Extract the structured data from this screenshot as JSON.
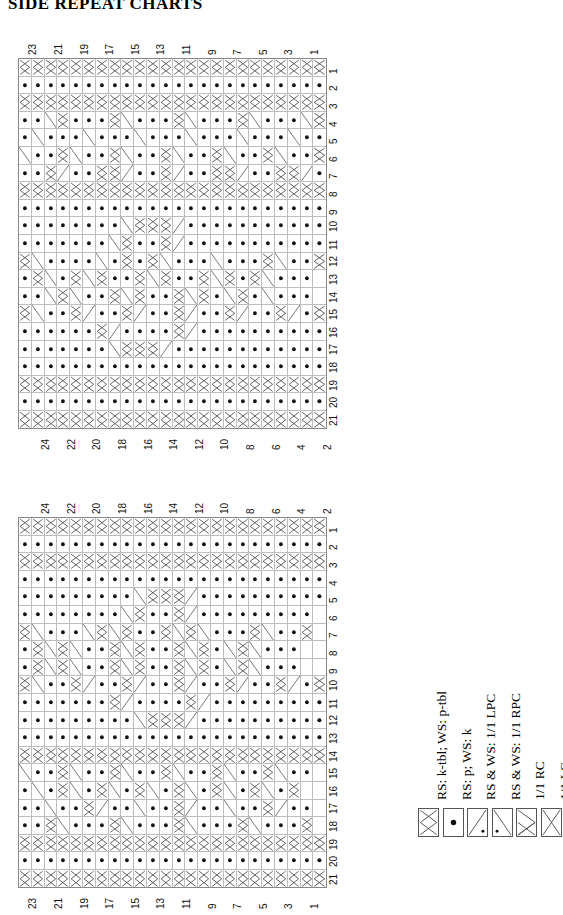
{
  "page": {
    "title": "SIDE REPEAT CHARTS"
  },
  "charts": [
    {
      "id": "chart-top",
      "name": "side-repeat-chart-1",
      "columns": 24,
      "rows": 21,
      "top_axis_label_parity": "odd",
      "bottom_axis_label_parity": "even",
      "top_axis_labels": [
        "23",
        "21",
        "19",
        "17",
        "15",
        "13",
        "11",
        "9",
        "7",
        "5",
        "3",
        "1"
      ],
      "bottom_axis_labels": [
        "24",
        "22",
        "20",
        "18",
        "16",
        "14",
        "12",
        "10",
        "8",
        "6",
        "4",
        "2"
      ],
      "row_labels": [
        "1",
        "2",
        "3",
        "4",
        "5",
        "6",
        "7",
        "8",
        "9",
        "10",
        "11",
        "12",
        "13",
        "14",
        "15",
        "16",
        "17",
        "18",
        "19",
        "20",
        "21"
      ]
    },
    {
      "id": "chart-bottom",
      "name": "side-repeat-chart-2",
      "columns": 24,
      "rows": 21,
      "top_axis_label_parity": "even",
      "bottom_axis_label_parity": "odd",
      "top_axis_labels": [
        "24",
        "22",
        "20",
        "18",
        "16",
        "14",
        "12",
        "10",
        "8",
        "6",
        "4",
        "2"
      ],
      "bottom_axis_labels": [
        "23",
        "21",
        "19",
        "17",
        "15",
        "13",
        "11",
        "9",
        "7",
        "5",
        "3",
        "1"
      ],
      "row_labels": [
        "1",
        "2",
        "3",
        "4",
        "5",
        "6",
        "7",
        "8",
        "9",
        "10",
        "11",
        "12",
        "13",
        "14",
        "15",
        "16",
        "17",
        "18",
        "19",
        "20",
        "21"
      ]
    }
  ],
  "legend": {
    "name": "stitch-key",
    "items": [
      {
        "symbol": "twisted-knit-icon",
        "glyph": "tw",
        "label": "RS: k-tbl; WS: p-tbl"
      },
      {
        "symbol": "purl-dot-icon",
        "glyph": "dot",
        "label": "RS: p; WS: k"
      },
      {
        "symbol": "lpc-icon",
        "glyph": "lpc",
        "label": "RS & WS: 1/1 LPC"
      },
      {
        "symbol": "rpc-icon",
        "glyph": "rpc",
        "label": "RS & WS: 1/1 RPC"
      },
      {
        "symbol": "rc-icon",
        "glyph": "rc",
        "label": "1/1 RC"
      },
      {
        "symbol": "lc-icon",
        "glyph": "lc",
        "label": "1/1 LC"
      }
    ]
  },
  "colors": {
    "grid_line": "#bdbdbd",
    "grid_border": "#888888",
    "symbol_stroke": "#555555",
    "text": "#000000",
    "background": "#ffffff"
  },
  "chart_data": {
    "type": "table",
    "title": "SIDE REPEAT CHARTS",
    "legend_codes": {
      "t": "RS: k-tbl; WS: p-tbl",
      "p": "RS: p; WS: k",
      "/": "RS & WS: 1/1 LPC",
      "\\": "RS & WS: 1/1 RPC",
      "X": "1/1 RC",
      "Y": "1/1 LC"
    },
    "charts": [
      {
        "name": "chart-1",
        "columns": 24,
        "rows": 21,
        "cells": [
          "tttttttttttttttttttttttt",
          "pppppppppppppppppppppppp",
          "tttttttttttttttttttttttt",
          "pp\\tpppt\\pppt\\pppt\\ppp\\t",
          "p\\ppp\\ppp\\ppp\\ppp\\ppp\\pp",
          "\\ppt\\ppt\\ppt\\ppt\\ppt\\ppt",
          "ppt/pptt/ppt/pptt/pptt/p",
          "tttttttttttttttttttttttt",
          "pppppppppppppppppppppppp",
          "pppppppp\\ttt/pppppppppppp",
          "ppppppp\\tppt/ppppppppppp",
          "t\\pppp\\ptpt\\ppp\\pppt\\ppt",
          "pt\\pt\\tppt\\tppt\\tpt\\ppp",
          "pp\\t\\ppt\\tppt\\tp\\tp\\ppp",
          "t\\ppt/ppt/ppt/ppt/ppt/pt",
          "ppppppt/ppppt/pppppppppp",
          "ppppppp\\ttt/pppppppppppp",
          "pppppppppppppppppppppppp",
          "tttttttttttttttttttttttt",
          "pppppppppppppppppppppppp",
          "tttttttttttttttttttttttt"
        ]
      },
      {
        "name": "chart-2",
        "columns": 24,
        "rows": 21,
        "cells": [
          "tttttttttttttttttttttttt",
          "pppppppppppppppppppppppp",
          "tttttttttttttttttttttttt",
          "pppppppppppppppppppppppp",
          "ppppppppp\\ttt/pppppppppp",
          "pppppppp\\tppt/ppppppppp",
          "t\\ppp\\t\\tppt\\t\\pppt\\ppt",
          "pt\\t\\ppt\\tppt\\tp\\t\\ppp",
          "pt\\t\\ppt\\tppt\\tp\\t\\ppp",
          "t\\ppt/ppt/ppt/ppt/ppt/pt",
          "pppppppt/ppppt/ppppppppp",
          "ppppppppp\\ttt/pppppppppp",
          "pppppppppppppppppppppppp",
          "tttttttttttttttttttttttt",
          "\\ppt\\ppt\\ppt\\ppt\\ppt\\pp",
          "p\\pt\\pt\\pt\\pt\\pt\\pt\\pt",
          "pp\\ppt/pp\\ppt/pp\\ppt/pp",
          "ppt\\pppt\\pppt\\pppt\\pppt",
          "tttttttttttttttttttttttt",
          "pppppppppppppppppppppppp",
          "tttttttttttttttttttttttt"
        ]
      }
    ]
  }
}
